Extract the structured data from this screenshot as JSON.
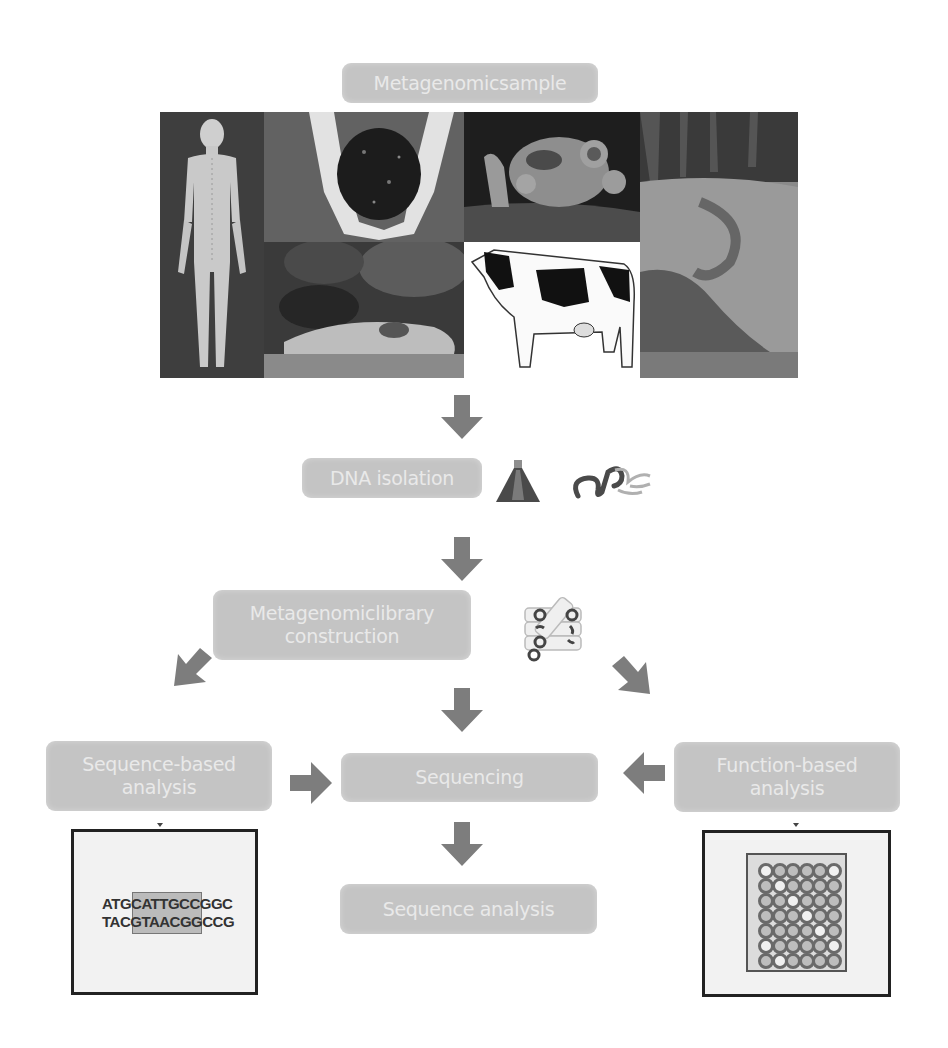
{
  "diagram": {
    "title_box": {
      "label": "Metagenomicsample"
    },
    "sample_images": [
      {
        "name": "human-body",
        "caption": ""
      },
      {
        "name": "soil-in-hands",
        "caption": ""
      },
      {
        "name": "microbial-biofilm",
        "caption": ""
      },
      {
        "name": "river-sediment",
        "caption": ""
      },
      {
        "name": "animal-burrow",
        "caption": ""
      },
      {
        "name": "cow",
        "caption": ""
      }
    ],
    "steps": {
      "dna_isolation": {
        "label": "DNA isolation"
      },
      "library": {
        "label_line1": "Metagenomiclibrary",
        "label_line2": "construction"
      },
      "sequence_based": {
        "label_line1": "Sequence-based",
        "label_line2": "analysis"
      },
      "sequencing": {
        "label": "Sequencing"
      },
      "function_based": {
        "label_line1": "Function-based",
        "label_line2": "analysis"
      },
      "sequence_analysis": {
        "label": "Sequence analysis"
      }
    },
    "sequence_panel": {
      "line1": "ATGCATTGCCGGC",
      "line2": "TACGTAACGGCCG"
    },
    "plate_panel": {
      "rows": 7,
      "cols": 6
    },
    "colors": {
      "box_fill": "#c4c4c4",
      "box_text": "#e9e9e9",
      "arrow_fill": "#7d7d7d"
    }
  }
}
